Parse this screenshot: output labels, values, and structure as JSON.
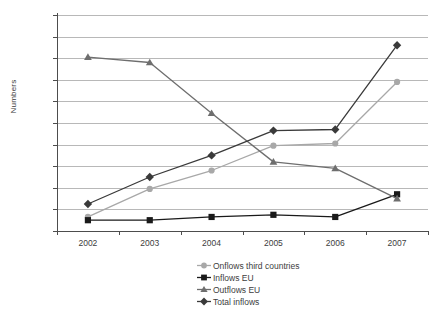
{
  "chart_data": {
    "type": "line",
    "title": "",
    "xlabel": "",
    "ylabel": "Numbers",
    "categories": [
      "2002",
      "2003",
      "2004",
      "2005",
      "2006",
      "2007"
    ],
    "ylim": [
      0,
      2000
    ],
    "ytick_step": 200,
    "ytick_labels": [
      "0",
      "200",
      "400",
      "600",
      "800",
      "1 000",
      "1 200",
      "1 400",
      "1 600",
      "1 800",
      "2 000"
    ],
    "grid": true,
    "legend_position": "bottom",
    "series": [
      {
        "name": "Onflows third countries",
        "values": [
          130,
          390,
          560,
          790,
          810,
          1380
        ],
        "color": "#a8a8a8",
        "marker": "circle"
      },
      {
        "name": "Inflows EU",
        "values": [
          100,
          100,
          130,
          150,
          130,
          340
        ],
        "color": "#1a1a1a",
        "marker": "square"
      },
      {
        "name": "Outflows EU",
        "values": [
          1610,
          1560,
          1090,
          640,
          580,
          300
        ],
        "color": "#6e6e6e",
        "marker": "triangle"
      },
      {
        "name": "Total inflows",
        "values": [
          250,
          500,
          700,
          930,
          940,
          1720
        ],
        "color": "#3a3a3a",
        "marker": "diamond"
      }
    ]
  },
  "axis": {
    "y_title": "Numbers"
  }
}
